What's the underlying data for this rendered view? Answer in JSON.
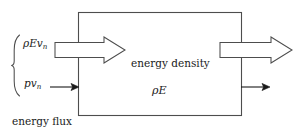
{
  "figure": {
    "type": "control-volume-energy-flux-diagram",
    "background_color": "#ffffff",
    "line_color": "#4d4d4d",
    "text_color": "#1a1a1a",
    "labels": {
      "flux_energy_advection": "ρEv",
      "flux_energy_advection_sub": "n",
      "flux_pressure_work": "pv",
      "flux_pressure_work_sub": "n",
      "interior_title": "energy density",
      "interior_quantity": "ρE",
      "caption": "energy flux"
    },
    "box": {
      "x": 78,
      "y": 12,
      "width": 164,
      "height": 104
    },
    "arrows": [
      {
        "name": "inflow-block-arrow",
        "style": "block-outline",
        "direction": "right",
        "x1": 55,
        "x2": 125,
        "y_center": 50
      },
      {
        "name": "outflow-block-arrow",
        "style": "block-outline",
        "direction": "right",
        "x1": 220,
        "x2": 292,
        "y_center": 50
      },
      {
        "name": "inflow-thin-arrow",
        "style": "thin-solid-head",
        "direction": "right",
        "x1": 50,
        "x2": 79,
        "y_center": 87
      },
      {
        "name": "outflow-thin-arrow",
        "style": "thin-solid-head",
        "direction": "right",
        "x1": 241,
        "x2": 270,
        "y_center": 87
      }
    ],
    "brace": {
      "name": "flux-grouping-brace",
      "x": 13,
      "y_top": 35,
      "y_bottom": 96
    }
  }
}
